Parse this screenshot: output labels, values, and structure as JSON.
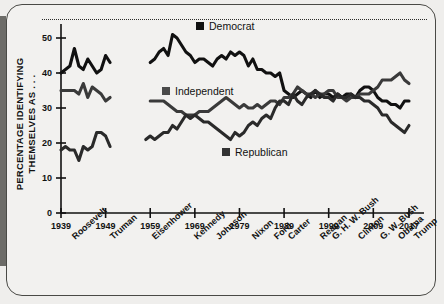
{
  "figure": {
    "y_axis_title": "PERCENTAGE IDENTIFYING THEMSELVES AS . . ."
  },
  "legend": [
    {
      "label": "Democrat",
      "color": "#111111",
      "icon": "square-marker"
    },
    {
      "label": "Independent",
      "color": "#4a4a4a",
      "icon": "square-marker"
    },
    {
      "label": "Republican",
      "color": "#333333",
      "icon": "square-marker"
    }
  ],
  "presidents": [
    "Roosevelt",
    "Truman",
    "Eisenhower",
    "Kennedy",
    "Johnson",
    "Nixon",
    "Ford",
    "Carter",
    "Reagan",
    "G. H. W. Bush",
    "Clinton",
    "G. W. Bush",
    "Obama",
    "Trump"
  ],
  "chart_data": {
    "type": "line",
    "title": "",
    "xlabel": "",
    "ylabel": "PERCENTAGE IDENTIFYING THEMSELVES AS . . .",
    "xlim": [
      1939,
      2017
    ],
    "ylim": [
      0,
      54
    ],
    "yticks": [
      0,
      10,
      20,
      30,
      40,
      50
    ],
    "xticks": [
      1939,
      1949,
      1959,
      1969,
      1979,
      1989,
      1999,
      2009,
      2017
    ],
    "grid": false,
    "legend_position": "inline-annotations",
    "series": [
      {
        "name": "Democrat",
        "color": "#111111",
        "x": [
          1939,
          1940,
          1941,
          1942,
          1943,
          1944,
          1945,
          1946,
          1947,
          1948,
          1949,
          1950,
          1959,
          1960,
          1961,
          1962,
          1963,
          1964,
          1965,
          1966,
          1967,
          1968,
          1969,
          1970,
          1971,
          1972,
          1973,
          1974,
          1975,
          1976,
          1977,
          1978,
          1979,
          1980,
          1981,
          1982,
          1983,
          1984,
          1985,
          1986,
          1987,
          1988,
          1989,
          1990,
          1991,
          1992,
          1993,
          1994,
          1995,
          1996,
          1997,
          1998,
          1999,
          2000,
          2001,
          2002,
          2003,
          2004,
          2005,
          2006,
          2007,
          2008,
          2009,
          2010,
          2011,
          2012,
          2013,
          2014,
          2015,
          2016,
          2017
        ],
        "values": [
          40,
          41,
          42,
          47,
          42,
          41,
          44,
          42,
          40,
          41,
          45,
          43,
          43,
          44,
          46,
          47,
          45,
          51,
          50,
          48,
          46,
          45,
          43,
          44,
          44,
          43,
          42,
          44,
          45,
          44,
          46,
          45,
          46,
          45,
          42,
          44,
          41,
          41,
          40,
          40,
          39,
          40,
          35,
          34,
          33,
          34,
          35,
          34,
          33,
          35,
          33,
          34,
          34,
          33,
          34,
          33,
          34,
          34,
          33,
          35,
          36,
          36,
          35,
          33,
          32,
          32,
          31,
          31,
          30,
          32,
          32
        ]
      },
      {
        "name": "Independent",
        "color": "#4a4a4a",
        "x": [
          1939,
          1940,
          1941,
          1942,
          1943,
          1944,
          1945,
          1946,
          1947,
          1948,
          1949,
          1950,
          1959,
          1960,
          1961,
          1962,
          1963,
          1964,
          1965,
          1966,
          1967,
          1968,
          1969,
          1970,
          1971,
          1972,
          1973,
          1974,
          1975,
          1976,
          1977,
          1978,
          1979,
          1980,
          1981,
          1982,
          1983,
          1984,
          1985,
          1986,
          1987,
          1988,
          1989,
          1990,
          1991,
          1992,
          1993,
          1994,
          1995,
          1996,
          1997,
          1998,
          1999,
          2000,
          2001,
          2002,
          2003,
          2004,
          2005,
          2006,
          2007,
          2008,
          2009,
          2010,
          2011,
          2012,
          2013,
          2014,
          2015,
          2016,
          2017
        ],
        "values": [
          35,
          35,
          35,
          35,
          34,
          37,
          33,
          36,
          35,
          34,
          32,
          33,
          32,
          32,
          32,
          32,
          31,
          30,
          29,
          29,
          28,
          28,
          28,
          29,
          29,
          29,
          30,
          31,
          32,
          33,
          32,
          31,
          30,
          31,
          30,
          30,
          31,
          30,
          31,
          32,
          32,
          31,
          33,
          33,
          34,
          36,
          35,
          34,
          34,
          33,
          34,
          34,
          35,
          35,
          33,
          33,
          32,
          33,
          33,
          34,
          34,
          34,
          35,
          36,
          38,
          38,
          38,
          39,
          40,
          38,
          37
        ]
      },
      {
        "name": "Republican",
        "color": "#333333",
        "x": [
          1939,
          1940,
          1941,
          1942,
          1943,
          1944,
          1945,
          1946,
          1947,
          1948,
          1949,
          1950,
          1958,
          1959,
          1960,
          1961,
          1962,
          1963,
          1964,
          1965,
          1966,
          1967,
          1968,
          1969,
          1970,
          1971,
          1972,
          1973,
          1974,
          1975,
          1976,
          1977,
          1978,
          1979,
          1980,
          1981,
          1982,
          1983,
          1984,
          1985,
          1986,
          1987,
          1988,
          1989,
          1990,
          1991,
          1992,
          1993,
          1994,
          1995,
          1996,
          1997,
          1998,
          1999,
          2000,
          2001,
          2002,
          2003,
          2004,
          2005,
          2006,
          2007,
          2008,
          2009,
          2010,
          2011,
          2012,
          2013,
          2014,
          2015,
          2016,
          2017
        ],
        "values": [
          18,
          19,
          18,
          18,
          15,
          19,
          18,
          19,
          23,
          23,
          22,
          19,
          21,
          22,
          21,
          22,
          23,
          23,
          25,
          24,
          26,
          28,
          27,
          28,
          27,
          26,
          26,
          25,
          24,
          23,
          22,
          21,
          23,
          22,
          23,
          25,
          26,
          25,
          27,
          28,
          27,
          30,
          32,
          32,
          31,
          34,
          32,
          31,
          33,
          34,
          35,
          34,
          33,
          33,
          32,
          34,
          33,
          33,
          34,
          33,
          33,
          32,
          32,
          31,
          30,
          28,
          28,
          26,
          25,
          24,
          23,
          25
        ]
      }
    ]
  }
}
